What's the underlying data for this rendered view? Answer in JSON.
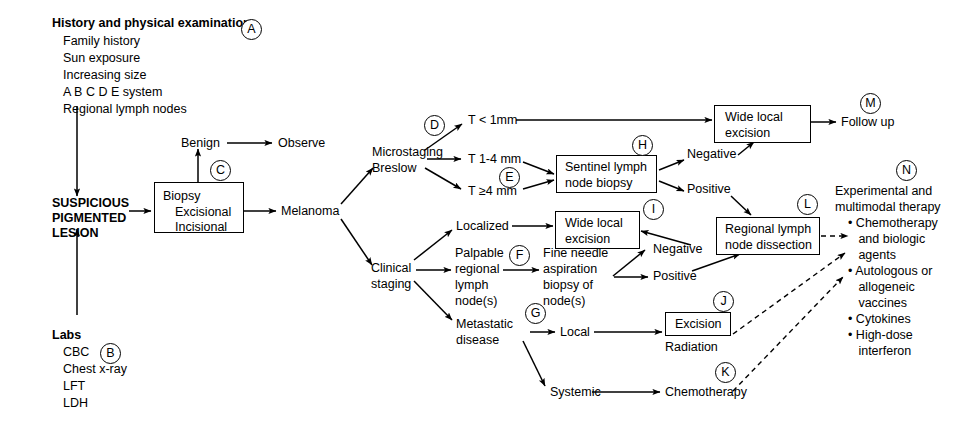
{
  "nodes": {
    "history_heading": "History and physical examination",
    "history_items": [
      "Family history",
      "Sun exposure",
      "Increasing size",
      "A B C D E system",
      "Regional lymph nodes"
    ],
    "labs_heading": "Labs",
    "labs_items": [
      "CBC",
      "Chest x-ray",
      "LFT",
      "LDH"
    ],
    "suspicious_line1": "SUSPICIOUS",
    "suspicious_line2": "PIGMENTED",
    "suspicious_line3": "LESION",
    "biopsy_line1": "Biopsy",
    "biopsy_line2": "Excisional",
    "biopsy_line3": "Incisional",
    "benign": "Benign",
    "observe": "Observe",
    "melanoma": "Melanoma",
    "microstaging": "Microstaging",
    "breslow": "Breslow",
    "t_lt_1mm": "T < 1mm",
    "t_1_4mm": "T 1-4 mm",
    "t_ge_4mm": "T ≥4 mm",
    "sentinel_line1": "Sentinel lymph",
    "sentinel_line2": "node biopsy",
    "sentinel_negative": "Negative",
    "sentinel_positive": "Positive",
    "wide_local_top_line1": "Wide local",
    "wide_local_top_line2": "excision",
    "follow_up": "Follow up",
    "clinical_line1": "Clinical",
    "clinical_line2": "staging",
    "localized": "Localized",
    "wide_local_mid_line1": "Wide local",
    "wide_local_mid_line2": "excision",
    "palpable_line1": "Palpable",
    "palpable_line2": "regional",
    "palpable_line3": "lymph",
    "palpable_line4": "node(s)",
    "fna_line1": "Fine needle",
    "fna_line2": "aspiration",
    "fna_line3": "biopsy of",
    "fna_line4": "node(s)",
    "fna_negative": "Negative",
    "fna_positive": "Positive",
    "rlnd_line1": "Regional lymph",
    "rlnd_line2": "node dissection",
    "metastatic_line1": "Metastatic",
    "metastatic_line2": "disease",
    "local": "Local",
    "excision": "Excision",
    "radiation": "Radiation",
    "systemic": "Systemic",
    "chemotherapy": "Chemotherapy",
    "therapy_heading_line1": "Experimental and",
    "therapy_heading_line2": "multimodal therapy",
    "therapy_bullets": [
      "• Chemotherapy",
      "   and biologic",
      "   agents",
      "• Autologous or",
      "   allogeneic",
      "   vaccines",
      "• Cytokines",
      "• High-dose",
      "   interferon"
    ]
  },
  "keys": {
    "a": "A",
    "b": "B",
    "c": "C",
    "d": "D",
    "e": "E",
    "f": "F",
    "g": "G",
    "h": "H",
    "i": "I",
    "j": "J",
    "k": "K",
    "l": "L",
    "m": "M",
    "n": "N"
  },
  "colors": {
    "ink": "#000000",
    "paper": "#ffffff"
  }
}
